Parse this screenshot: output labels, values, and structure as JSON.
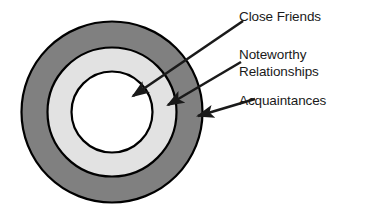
{
  "diagram": {
    "type": "concentric-rings",
    "center": {
      "x": 112,
      "y": 112
    },
    "rings": [
      {
        "id": "acquaintances",
        "label": "Acquaintances",
        "radius": 91,
        "fill": "#808080",
        "stroke": "#000000",
        "stroke_width": 2,
        "order": "outer"
      },
      {
        "id": "noteworthy-relationships",
        "label": "Noteworthy Relationships",
        "label_line_1": "Noteworthy",
        "label_line_2": "Relationships",
        "radius": 65,
        "fill": "#e2e2e2",
        "stroke": "#000000",
        "stroke_width": 2,
        "order": "middle"
      },
      {
        "id": "close-friends",
        "label": "Close Friends",
        "radius": 41,
        "fill": "#ffffff",
        "stroke": "#000000",
        "stroke_width": 2,
        "order": "inner"
      }
    ],
    "arrows": [
      {
        "id": "arrow-close-friends",
        "target_ring": "close-friends",
        "from": {
          "x": 243,
          "y": 21
        },
        "to": {
          "x": 130,
          "y": 99
        },
        "color": "#1a1a1a"
      },
      {
        "id": "arrow-noteworthy-relationships",
        "target_ring": "noteworthy-relationships",
        "from": {
          "x": 241,
          "y": 62
        },
        "to": {
          "x": 165,
          "y": 107
        },
        "color": "#1a1a1a"
      },
      {
        "id": "arrow-acquaintances",
        "target_ring": "acquaintances",
        "from": {
          "x": 255,
          "y": 99
        },
        "to": {
          "x": 195,
          "y": 117
        },
        "color": "#1a1a1a"
      }
    ],
    "labels": {
      "close_friends": "Close Friends",
      "noteworthy_line1": "Noteworthy",
      "noteworthy_line2": "Relationships",
      "acquaintances": "Acquaintances"
    },
    "colors": {
      "outer_ring": "#808080",
      "middle_ring": "#e2e2e2",
      "inner_ring": "#ffffff",
      "outline": "#000000",
      "text": "#1a1a1a",
      "background": "#ffffff"
    }
  }
}
